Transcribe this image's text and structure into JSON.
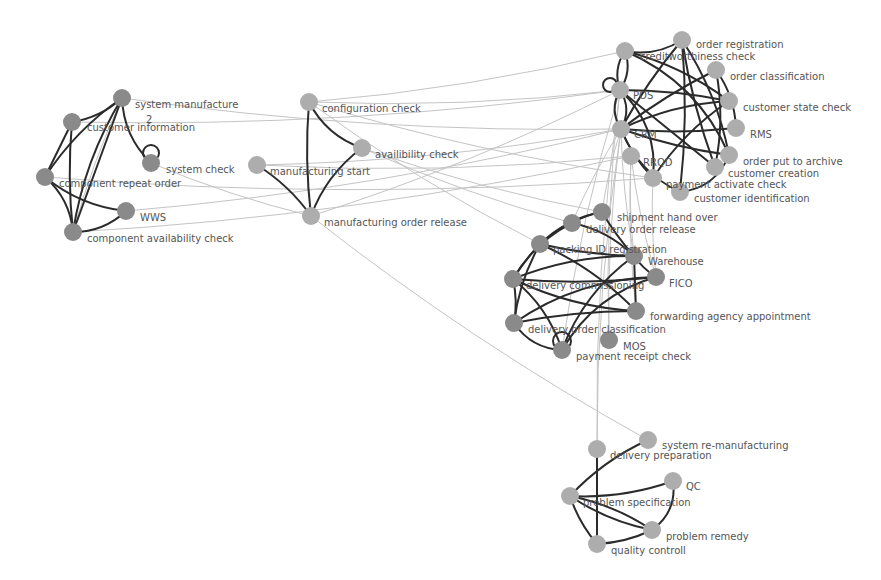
{
  "colors": {
    "background": "#ffffff",
    "node_dark": "#8a8a8a",
    "node_light": "#adadad",
    "edge_strong": "#2b2b2b",
    "edge_weak": "#c4c4c4",
    "label": "#555555"
  },
  "node_radius": 9,
  "nodes": [
    {
      "id": "sm",
      "label": "system manufacture",
      "x": 122,
      "y": 98,
      "tone": "dark",
      "lx": 135,
      "ly": 108
    },
    {
      "id": "ci",
      "label": "customer information",
      "x": 72,
      "y": 122,
      "tone": "dark",
      "lx": 87,
      "ly": 131
    },
    {
      "id": "sc",
      "label": "system check",
      "x": 151,
      "y": 163,
      "tone": "dark",
      "lx": 166,
      "ly": 173
    },
    {
      "id": "cro",
      "label": "component repeat order",
      "x": 45,
      "y": 177,
      "tone": "dark",
      "lx": 59,
      "ly": 187
    },
    {
      "id": "wws",
      "label": "WWS",
      "x": 126,
      "y": 211,
      "tone": "dark",
      "lx": 140,
      "ly": 221
    },
    {
      "id": "cac",
      "label": "component availability check",
      "x": 73,
      "y": 232,
      "tone": "dark",
      "lx": 87,
      "ly": 242
    },
    {
      "id": "cfg",
      "label": "configuration check",
      "x": 309,
      "y": 102,
      "tone": "light",
      "lx": 322,
      "ly": 112
    },
    {
      "id": "avc",
      "label": "availibility check",
      "x": 362,
      "y": 148,
      "tone": "light",
      "lx": 375,
      "ly": 158
    },
    {
      "id": "mst",
      "label": "manufacturing start",
      "x": 257,
      "y": 165,
      "tone": "light",
      "lx": 270,
      "ly": 175
    },
    {
      "id": "mor",
      "label": "manufacturing order release",
      "x": 311,
      "y": 216,
      "tone": "light",
      "lx": 324,
      "ly": 226
    },
    {
      "id": "oreg",
      "label": "order registration",
      "x": 682,
      "y": 40,
      "tone": "light",
      "lx": 696,
      "ly": 48
    },
    {
      "id": "cwc",
      "label": "creditworthiness check",
      "x": 625,
      "y": 51,
      "tone": "light",
      "lx": 640,
      "ly": 60
    },
    {
      "id": "ocl",
      "label": "order classification",
      "x": 716,
      "y": 70,
      "tone": "light",
      "lx": 730,
      "ly": 80
    },
    {
      "id": "pos",
      "label": "POS",
      "x": 620,
      "y": 90,
      "tone": "light",
      "lx": 633,
      "ly": 99
    },
    {
      "id": "csc",
      "label": "customer state check",
      "x": 729,
      "y": 101,
      "tone": "light",
      "lx": 743,
      "ly": 111
    },
    {
      "id": "crm",
      "label": "CRM",
      "x": 621,
      "y": 129,
      "tone": "light",
      "lx": 634,
      "ly": 138
    },
    {
      "id": "rms",
      "label": "RMS",
      "x": 736,
      "y": 128,
      "tone": "light",
      "lx": 750,
      "ly": 138
    },
    {
      "id": "rrqd",
      "label": "RRQD",
      "x": 631,
      "y": 156,
      "tone": "light",
      "lx": 643,
      "ly": 166
    },
    {
      "id": "opa",
      "label": "order put to archive",
      "x": 729,
      "y": 155,
      "tone": "light",
      "lx": 743,
      "ly": 165
    },
    {
      "id": "cc",
      "label": "customer creation",
      "x": 715,
      "y": 167,
      "tone": "light",
      "lx": 728,
      "ly": 177
    },
    {
      "id": "pac",
      "label": "payment activate check",
      "x": 653,
      "y": 178,
      "tone": "light",
      "lx": 666,
      "ly": 188
    },
    {
      "id": "cid",
      "label": "customer identification",
      "x": 680,
      "y": 192,
      "tone": "light",
      "lx": 694,
      "ly": 202
    },
    {
      "id": "sho",
      "label": "shipment hand over",
      "x": 602,
      "y": 212,
      "tone": "dark",
      "lx": 617,
      "ly": 221
    },
    {
      "id": "dor",
      "label": "delivery order release",
      "x": 572,
      "y": 223,
      "tone": "dark",
      "lx": 586,
      "ly": 233
    },
    {
      "id": "pid",
      "label": "packing ID registration",
      "x": 540,
      "y": 244,
      "tone": "dark",
      "lx": 553,
      "ly": 253
    },
    {
      "id": "wh",
      "label": "Warehouse",
      "x": 634,
      "y": 256,
      "tone": "dark",
      "lx": 648,
      "ly": 265
    },
    {
      "id": "fico",
      "label": "FICO",
      "x": 656,
      "y": 277,
      "tone": "dark",
      "lx": 669,
      "ly": 287
    },
    {
      "id": "dcm",
      "label": "delivery commissioning",
      "x": 513,
      "y": 279,
      "tone": "dark",
      "lx": 526,
      "ly": 289
    },
    {
      "id": "faa",
      "label": "forwarding agency appointment",
      "x": 636,
      "y": 311,
      "tone": "dark",
      "lx": 650,
      "ly": 320
    },
    {
      "id": "doc",
      "label": "delivery order classification",
      "x": 514,
      "y": 323,
      "tone": "dark",
      "lx": 528,
      "ly": 333
    },
    {
      "id": "mos",
      "label": "MOS",
      "x": 609,
      "y": 340,
      "tone": "dark",
      "lx": 623,
      "ly": 350
    },
    {
      "id": "prc",
      "label": "payment receipt check",
      "x": 562,
      "y": 350,
      "tone": "dark",
      "lx": 576,
      "ly": 360
    },
    {
      "id": "srm",
      "label": "system re-manufacturing",
      "x": 648,
      "y": 440,
      "tone": "light",
      "lx": 662,
      "ly": 449
    },
    {
      "id": "dpr",
      "label": "delivery preparation",
      "x": 597,
      "y": 449,
      "tone": "light",
      "lx": 610,
      "ly": 459
    },
    {
      "id": "qc",
      "label": "QC",
      "x": 673,
      "y": 481,
      "tone": "light",
      "lx": 686,
      "ly": 490
    },
    {
      "id": "psp",
      "label": "problem specification",
      "x": 570,
      "y": 496,
      "tone": "light",
      "lx": 583,
      "ly": 506
    },
    {
      "id": "prm",
      "label": "problem remedy",
      "x": 652,
      "y": 530,
      "tone": "light",
      "lx": 666,
      "ly": 540
    },
    {
      "id": "qct",
      "label": "quality controll",
      "x": 597,
      "y": 544,
      "tone": "light",
      "lx": 611,
      "ly": 554
    }
  ],
  "annotations": [
    {
      "text": "2",
      "x": 146,
      "y": 123
    }
  ],
  "strong_edges": [
    [
      "sm",
      "ci",
      -0.15
    ],
    [
      "sm",
      "cro",
      0.1
    ],
    [
      "sm",
      "cac",
      0.0
    ],
    [
      "sm",
      "sc",
      0.2
    ],
    [
      "ci",
      "cac",
      0.05
    ],
    [
      "ci",
      "cro",
      0
    ],
    [
      "cro",
      "cac",
      -0.2
    ],
    [
      "cro",
      "wws",
      0.15
    ],
    [
      "cac",
      "wws",
      0.2
    ],
    [
      "cac",
      "sm",
      -0.1
    ],
    [
      "cfg",
      "mor",
      0.05
    ],
    [
      "cfg",
      "avc",
      0.2
    ],
    [
      "avc",
      "mor",
      0.15
    ],
    [
      "mst",
      "mor",
      -0.1
    ],
    [
      "cwc",
      "pos",
      0.25
    ],
    [
      "cwc",
      "pos",
      -0.25
    ],
    [
      "pos",
      "crm",
      0.3
    ],
    [
      "pos",
      "crm",
      -0.3
    ],
    [
      "crm",
      "pac",
      0.1
    ],
    [
      "crm",
      "cid",
      0.2
    ],
    [
      "cwc",
      "oreg",
      0.2
    ],
    [
      "cwc",
      "csc",
      -0.1
    ],
    [
      "cwc",
      "opa",
      -0.2
    ],
    [
      "oreg",
      "crm",
      0.05
    ],
    [
      "oreg",
      "cc",
      0.05
    ],
    [
      "oreg",
      "opa",
      -0.1
    ],
    [
      "ocl",
      "crm",
      0.05
    ],
    [
      "ocl",
      "rms",
      -0.15
    ],
    [
      "pos",
      "csc",
      -0.05
    ],
    [
      "pos",
      "cc",
      0.0
    ],
    [
      "crm",
      "rms",
      0.05
    ],
    [
      "crm",
      "opa",
      0.05
    ],
    [
      "csc",
      "crm",
      0.1
    ],
    [
      "csc",
      "pac",
      0.1
    ],
    [
      "pos",
      "pac",
      -0.25
    ],
    [
      "cid",
      "opa",
      0.3
    ],
    [
      "oreg",
      "cid",
      -0.05
    ],
    [
      "ocl",
      "cc",
      -0.1
    ],
    [
      "sho",
      "dor",
      0.1
    ],
    [
      "sho",
      "pid",
      0.15
    ],
    [
      "sho",
      "wh",
      0.05
    ],
    [
      "dor",
      "wh",
      -0.15
    ],
    [
      "dor",
      "dcm",
      0.15
    ],
    [
      "pid",
      "wh",
      0.05
    ],
    [
      "pid",
      "faa",
      -0.1
    ],
    [
      "pid",
      "dcm",
      0.05
    ],
    [
      "pid",
      "doc",
      0.1
    ],
    [
      "dcm",
      "wh",
      -0.1
    ],
    [
      "dcm",
      "doc",
      -0.1
    ],
    [
      "dcm",
      "prc",
      -0.15
    ],
    [
      "dcm",
      "faa",
      0.1
    ],
    [
      "doc",
      "fico",
      -0.15
    ],
    [
      "doc",
      "prc",
      0.25
    ],
    [
      "wh",
      "fico",
      0.1
    ],
    [
      "wh",
      "prc",
      0.15
    ],
    [
      "wh",
      "faa",
      0.0
    ],
    [
      "fico",
      "dcm",
      -0.05
    ],
    [
      "faa",
      "doc",
      0.05
    ],
    [
      "prc",
      "fico",
      -0.2
    ],
    [
      "dpr",
      "qct",
      0.0
    ],
    [
      "srm",
      "psp",
      0.1
    ],
    [
      "psp",
      "qc",
      0.1
    ],
    [
      "psp",
      "prm",
      -0.1
    ],
    [
      "psp",
      "qct",
      0.1
    ],
    [
      "qct",
      "prm",
      0.1
    ],
    [
      "qc",
      "prm",
      -0.3
    ],
    [
      "psp",
      "prm",
      0.1
    ]
  ],
  "self_loops": [
    {
      "node": "sc",
      "dx": 0,
      "dy": -10,
      "r": 8
    },
    {
      "node": "prc",
      "dx": 0,
      "dy": -9,
      "r": 9
    },
    {
      "node": "pos",
      "dx": -10,
      "dy": -5,
      "r": 7
    }
  ],
  "weak_edges": [
    [
      "sm",
      "crm"
    ],
    [
      "sm",
      "cac"
    ],
    [
      "ci",
      "pos"
    ],
    [
      "sc",
      "mor"
    ],
    [
      "cro",
      "pac"
    ],
    [
      "wws",
      "crm"
    ],
    [
      "cac",
      "rrqd"
    ],
    [
      "cfg",
      "cwc"
    ],
    [
      "cfg",
      "pos"
    ],
    [
      "cfg",
      "pac"
    ],
    [
      "cfg",
      "pid"
    ],
    [
      "avc",
      "dor"
    ],
    [
      "avc",
      "sho"
    ],
    [
      "mst",
      "crm"
    ],
    [
      "mst",
      "rrqd"
    ],
    [
      "mor",
      "pos"
    ],
    [
      "mor",
      "srm"
    ],
    [
      "crm",
      "dpr"
    ],
    [
      "crm",
      "sho"
    ],
    [
      "crm",
      "wh"
    ],
    [
      "rrqd",
      "wh"
    ],
    [
      "rrqd",
      "fico"
    ],
    [
      "pos",
      "mos"
    ],
    [
      "pac",
      "fico"
    ],
    [
      "pos",
      "prc"
    ],
    [
      "crm",
      "mos"
    ],
    [
      "pos",
      "dpr"
    ],
    [
      "rrqd",
      "faa"
    ],
    [
      "crm",
      "dor"
    ]
  ]
}
